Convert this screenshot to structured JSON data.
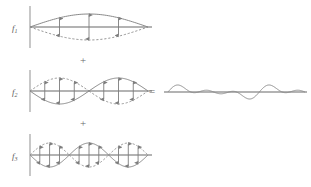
{
  "figure": {
    "background_color": "#ffffff",
    "stroke_color": "#8a8a8a",
    "axis_color": "#9a9a9a",
    "arrow_color": "#7d7d7d",
    "label_color": "#5a5a5a",
    "width": 311,
    "height": 187
  },
  "labels": {
    "f1": "f",
    "f1_sub": "1",
    "f2": "f",
    "f2_sub": "2",
    "f3": "f",
    "f3_sub": "3"
  },
  "operators": {
    "plus_1": "+",
    "plus_2": "+",
    "equals": "="
  },
  "chart_data": {
    "type": "line",
    "xlabel": "",
    "ylabel": "",
    "grid": false,
    "legend_position": "left",
    "axis_range_x": [
      0,
      1
    ],
    "panels": [
      {
        "name": "f1",
        "label": "f₁",
        "harmonic": 1,
        "half_wavelengths": 1,
        "amplitude": 1.0,
        "solid_phase": "positive",
        "dashed_phase": "negative",
        "arrow_count": 3,
        "arrow_positions": [
          0.25,
          0.5,
          0.75
        ],
        "description": "Fundamental mode: single antinode, solid envelope above axis, dashed mirror below"
      },
      {
        "name": "f2",
        "label": "f₂",
        "harmonic": 2,
        "half_wavelengths": 2,
        "amplitude": 1.0,
        "solid_phase": "alternating",
        "dashed_phase": "alternating",
        "arrow_count": 6,
        "arrow_positions": [
          0.125,
          0.25,
          0.375,
          0.625,
          0.75,
          0.875
        ],
        "description": "Second harmonic: two lobes with one node at centre; first lobe dashed above, second lobe solid above"
      },
      {
        "name": "f3",
        "label": "f₃",
        "harmonic": 3,
        "half_wavelengths": 3,
        "amplitude": 1.0,
        "solid_phase": "alternating",
        "dashed_phase": "alternating",
        "arrow_count": 9,
        "arrow_positions": [
          0.083,
          0.166,
          0.25,
          0.416,
          0.5,
          0.583,
          0.75,
          0.833,
          0.916
        ],
        "description": "Third harmonic: three lobes with two nodes"
      }
    ],
    "result": {
      "name": "sum",
      "description": "Sum f1 + f2 + f3 producing a composite rippled waveform about the axis",
      "series": [
        {
          "name": "f1+f2+f3",
          "components": [
            {
              "harmonic": 1,
              "amplitude": 1.0
            },
            {
              "harmonic": 2,
              "amplitude": 1.0
            },
            {
              "harmonic": 3,
              "amplitude": 1.0
            }
          ]
        }
      ]
    }
  }
}
